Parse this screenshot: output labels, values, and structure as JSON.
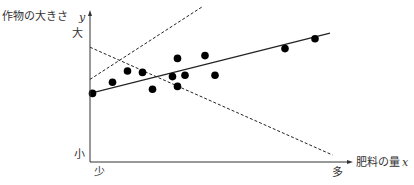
{
  "chart_data": {
    "type": "scatter",
    "title": "",
    "ylabel": "作物の大きさ",
    "ylabel_var": "y",
    "xlabel": "肥料の量",
    "xlabel_var": "x",
    "y_high_label": "大",
    "y_low_label": "小",
    "x_low_label": "少",
    "x_high_label": "多",
    "xlim": [
      0,
      10
    ],
    "ylim": [
      0,
      10
    ],
    "grid": false,
    "points": [
      {
        "x": 0.1,
        "y": 4.9
      },
      {
        "x": 0.9,
        "y": 5.7
      },
      {
        "x": 1.5,
        "y": 6.5
      },
      {
        "x": 2.1,
        "y": 6.4
      },
      {
        "x": 2.5,
        "y": 5.2
      },
      {
        "x": 3.5,
        "y": 7.4
      },
      {
        "x": 3.3,
        "y": 6.1
      },
      {
        "x": 3.8,
        "y": 6.2
      },
      {
        "x": 3.5,
        "y": 5.4
      },
      {
        "x": 4.6,
        "y": 7.6
      },
      {
        "x": 5.0,
        "y": 6.2
      },
      {
        "x": 7.8,
        "y": 8.1
      },
      {
        "x": 9.0,
        "y": 8.8
      }
    ],
    "lines": [
      {
        "name": "regression",
        "style": "solid",
        "from": {
          "x": 0,
          "y": 4.9
        },
        "to": {
          "x": 9.6,
          "y": 9.2
        }
      },
      {
        "name": "dashed-increasing",
        "style": "dashed",
        "from": {
          "x": 0,
          "y": 5.9
        },
        "to": {
          "x": 4.5,
          "y": 11.1
        }
      },
      {
        "name": "dashed-decreasing",
        "style": "dashed",
        "from": {
          "x": 0,
          "y": 8.2
        },
        "to": {
          "x": 9.7,
          "y": 0.5
        }
      }
    ]
  }
}
